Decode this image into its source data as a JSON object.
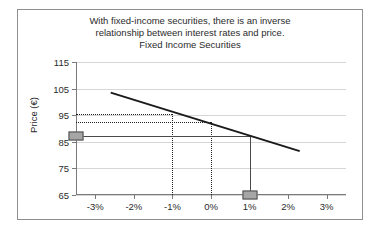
{
  "chart_data": {
    "type": "line",
    "title": "Fixed Income Securities",
    "caption_lines": [
      "With fixed-income securities, there is an inverse",
      "relationship between interest rates and price.",
      "Fixed Income Securities"
    ],
    "xlabel": "",
    "ylabel": "Price (€)",
    "xlim": [
      -3.5,
      3.5
    ],
    "ylim": [
      65,
      115
    ],
    "grid": true,
    "legend": "none",
    "x_tick_labels": [
      "-3%",
      "-2%",
      "-1%",
      "0%",
      "1%",
      "2%",
      "3%"
    ],
    "x_tick_values": [
      -3,
      -2,
      -1,
      0,
      1,
      2,
      3
    ],
    "y_tick_labels": [
      "65",
      "75",
      "85",
      "95",
      "105",
      "115"
    ],
    "y_tick_values": [
      65,
      75,
      85,
      95,
      105,
      115
    ],
    "series": [
      {
        "name": "Price vs. interest rate change",
        "x": [
          -2.6,
          2.3
        ],
        "values": [
          103.5,
          81.5
        ]
      }
    ],
    "annotations": [
      {
        "name": "guide-price-at-minus-1pct",
        "type": "dotted-horizontal",
        "y": 95.6,
        "x_from": -3.5,
        "x_to": -1.0
      },
      {
        "name": "guide-price-at-0pct",
        "type": "dotted-horizontal",
        "y": 92.3,
        "x_from": -3.5,
        "x_to": 0.0
      },
      {
        "name": "guide-rate-minus-1pct",
        "type": "dotted-vertical",
        "x": -1.0,
        "y_from": 65,
        "y_to": 95.6
      },
      {
        "name": "guide-rate-0pct",
        "type": "dotted-vertical",
        "x": 0.0,
        "y_from": 65,
        "y_to": 92.3
      },
      {
        "name": "guide-price-at-1pct",
        "type": "solid-horizontal",
        "y": 87.0,
        "x_from": -3.5,
        "x_to": 1.0
      },
      {
        "name": "guide-rate-1pct",
        "type": "solid-vertical",
        "x": 1.0,
        "y_from": 65,
        "y_to": 87.0
      }
    ],
    "markers": [
      {
        "name": "marker-price-axis",
        "x": -3.5,
        "y": 87.0
      },
      {
        "name": "marker-rate-1pct",
        "x": 1.0,
        "y": 65.0
      }
    ]
  }
}
